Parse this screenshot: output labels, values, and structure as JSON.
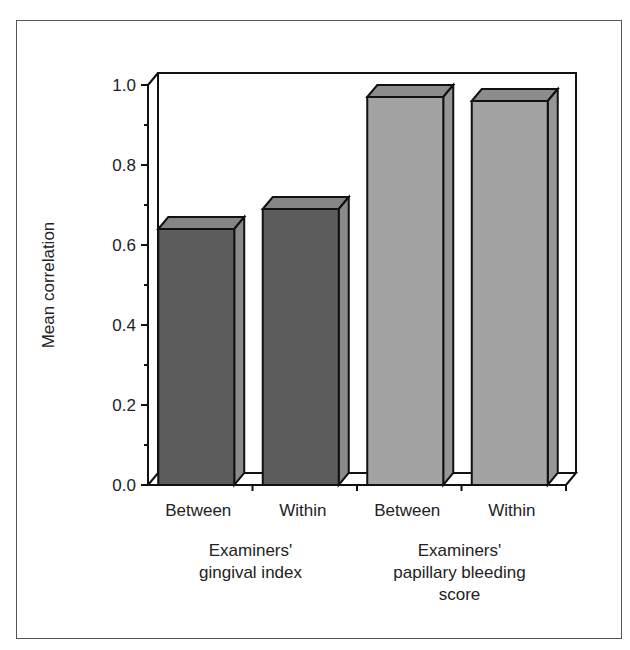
{
  "chart_data": {
    "type": "bar",
    "style": "3d",
    "title": "",
    "xlabel": "",
    "ylabel": "Mean correlation",
    "ylim": [
      0,
      1.0
    ],
    "yticks": [
      "0.0",
      "0.2",
      "0.4",
      "0.6",
      "0.8",
      "1.0"
    ],
    "grid": false,
    "legend": null,
    "categories": [
      "Between",
      "Within",
      "Between",
      "Within"
    ],
    "groups": [
      {
        "label_lines": [
          "Examiners'",
          "gingival index"
        ],
        "categories": [
          "Between",
          "Within"
        ]
      },
      {
        "label_lines": [
          "Examiners'",
          "papillary bleeding",
          "score"
        ],
        "categories": [
          "Between",
          "Within"
        ]
      }
    ],
    "values": [
      0.64,
      0.69,
      0.97,
      0.96
    ],
    "bar_colors": [
      "#5c5c5c",
      "#5c5c5c",
      "#a3a3a3",
      "#a3a3a3"
    ]
  },
  "colors": {
    "dark_front": "#5c5c5c",
    "dark_top": "#858585",
    "dark_side": "#8a8a8a",
    "light_front": "#a3a3a3",
    "light_top": "#8c8c8c",
    "light_side": "#969696"
  }
}
